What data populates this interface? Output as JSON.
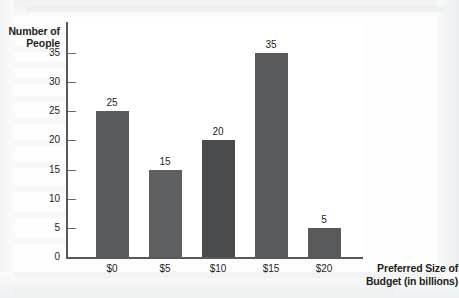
{
  "chart_data": {
    "type": "bar",
    "title": "",
    "xlabel": "Preferred Size of Budget (in billions)",
    "xlabel_line1": "Preferred Size of",
    "xlabel_line2": "Budget (in billions)",
    "ylabel": "Number of People",
    "ylabel_line1": "Number of",
    "ylabel_line2": "People",
    "categories": [
      "$0",
      "$5",
      "$10",
      "$15",
      "$20"
    ],
    "values": [
      25,
      15,
      20,
      35,
      5
    ],
    "value_labels": [
      "25",
      "15",
      "20",
      "35",
      "5"
    ],
    "ylim": [
      0,
      35
    ],
    "yticks": [
      0,
      5,
      10,
      15,
      20,
      25,
      30,
      35
    ],
    "ytick_labels": [
      "0",
      "5",
      "10",
      "15",
      "20",
      "25",
      "30",
      "35"
    ],
    "grid": false,
    "legend": false,
    "bar_colors": [
      "#58595b",
      "#5d5e60",
      "#4a4b4d",
      "#58595b",
      "#58595b"
    ],
    "axis_color": "#58595b",
    "plot_background": "#ffffff",
    "page_background": "#f2f3f5"
  }
}
